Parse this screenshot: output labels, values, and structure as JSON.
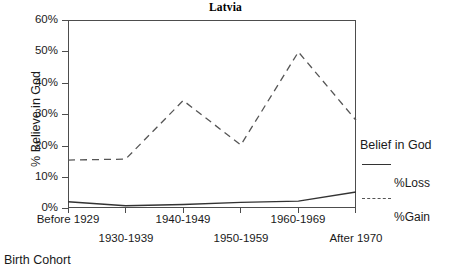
{
  "chart_data": {
    "type": "line",
    "title": "Latvia",
    "xlabel": "Birth Cohort",
    "ylabel": "% Believe in God",
    "categories": [
      "Before 1929",
      "1930-1939",
      "1940-1949",
      "1950-1959",
      "1960-1969",
      "After 1970"
    ],
    "xtick_labels": [
      "Before 1929",
      "1930-1939",
      "1940-1949",
      "1950-1959",
      "1960-1969",
      "After 1970"
    ],
    "ytick_labels": [
      "0%",
      "10%",
      "20%",
      "30%",
      "40%",
      "50%",
      "60%"
    ],
    "ytick_values": [
      0,
      10,
      20,
      30,
      40,
      50,
      60
    ],
    "ylim": [
      0,
      60
    ],
    "xlim": [
      0,
      5
    ],
    "grid": false,
    "legend_position": "right",
    "legend_title": "Belief in God",
    "series": [
      {
        "name": "%Loss",
        "style": "dashed",
        "color": "#555555",
        "values": [
          15.3,
          15.6,
          34.3,
          20.1,
          49.8,
          28.0
        ]
      },
      {
        "name": "%Gain",
        "style": "solid",
        "color": "#333333",
        "values": [
          2.0,
          0.7,
          1.1,
          1.8,
          2.2,
          5.1
        ]
      }
    ]
  },
  "title": {
    "text": "Latvia"
  },
  "axes": {
    "y_title": "% Believe in God",
    "x_title": "Birth Cohort",
    "y_ticks": [
      {
        "label": "60%",
        "value": 60
      },
      {
        "label": "50%",
        "value": 50
      },
      {
        "label": "40%",
        "value": 40
      },
      {
        "label": "30%",
        "value": 30
      },
      {
        "label": "20%",
        "value": 20
      },
      {
        "label": "10%",
        "value": 10
      },
      {
        "label": "0%",
        "value": 0
      }
    ],
    "x_ticks": [
      {
        "label": "Before 1929"
      },
      {
        "label": "1930-1939"
      },
      {
        "label": "1940-1949"
      },
      {
        "label": "1950-1959"
      },
      {
        "label": "1960-1969"
      },
      {
        "label": "After 1970"
      }
    ]
  },
  "legend": {
    "title": "Belief in God",
    "entries": [
      {
        "label": "%Loss",
        "style": "solid"
      },
      {
        "label": "%Gain",
        "style": "dashed"
      }
    ]
  },
  "colors": {
    "loss_line": "#555555",
    "gain_line": "#333333",
    "axis": "#4d4d4d",
    "text": "#1a1a1a",
    "background": "#ffffff"
  }
}
